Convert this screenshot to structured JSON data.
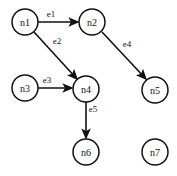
{
  "figure": {
    "type": "directed-graph",
    "background_color": "#ffffff",
    "stroke_color": "#111111",
    "node_fill_color": "#ffffff",
    "width": 177,
    "height": 176
  },
  "nodes": [
    {
      "id": "n1",
      "label": "n1",
      "cx": 25,
      "cy": 22,
      "r": 13
    },
    {
      "id": "n2",
      "label": "n2",
      "cx": 92,
      "cy": 22,
      "r": 13
    },
    {
      "id": "n3",
      "label": "n3",
      "cx": 25,
      "cy": 88,
      "r": 13
    },
    {
      "id": "n4",
      "label": "n4",
      "cx": 86,
      "cy": 89,
      "r": 13
    },
    {
      "id": "n5",
      "label": "n5",
      "cx": 155,
      "cy": 90,
      "r": 13
    },
    {
      "id": "n6",
      "label": "n6",
      "cx": 86,
      "cy": 152,
      "r": 13
    },
    {
      "id": "n7",
      "label": "n7",
      "cx": 155,
      "cy": 152,
      "r": 13
    }
  ],
  "edges": [
    {
      "id": "e1",
      "label": "e1",
      "source": "n1",
      "target": "n2",
      "x1": 38,
      "y1": 22,
      "x2": 78,
      "y2": 22,
      "label_x": 51,
      "label_y": 14
    },
    {
      "id": "e2",
      "label": "e2",
      "source": "n1",
      "target": "n4",
      "x1": 34,
      "y1": 32,
      "x2": 77,
      "y2": 79,
      "label_x": 57,
      "label_y": 41
    },
    {
      "id": "e3",
      "label": "e3",
      "source": "n3",
      "target": "n4",
      "x1": 38,
      "y1": 88,
      "x2": 72,
      "y2": 88,
      "label_x": 47,
      "label_y": 80
    },
    {
      "id": "e4",
      "label": "e4",
      "source": "n2",
      "target": "n5",
      "x1": 102,
      "y1": 32,
      "x2": 146,
      "y2": 79,
      "label_x": 127,
      "label_y": 44
    },
    {
      "id": "e5",
      "label": "e5",
      "source": "n4",
      "target": "n6",
      "x1": 86,
      "y1": 102,
      "x2": 86,
      "y2": 138,
      "label_x": 93,
      "label_y": 109
    }
  ]
}
